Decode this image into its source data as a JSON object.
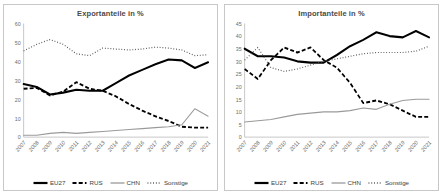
{
  "charts": [
    {
      "title": "Exportanteile in %",
      "ylim": [
        0,
        60
      ],
      "yticks": [
        0,
        10,
        20,
        30,
        40,
        50,
        60
      ]
    },
    {
      "title": "Importanteile in %",
      "ylim": [
        0,
        45
      ],
      "yticks": [
        0,
        5,
        10,
        15,
        20,
        25,
        30,
        35,
        40,
        45
      ]
    }
  ],
  "legend": [
    {
      "label": "EU27",
      "style": "solid-thick",
      "color": "#000000"
    },
    {
      "label": "RUS",
      "style": "dashed",
      "color": "#000000"
    },
    {
      "label": "CHN",
      "style": "solid-thin",
      "color": "#9a9a9a"
    },
    {
      "label": "Sonstige",
      "style": "dotted",
      "color": "#545454"
    }
  ],
  "chart_data": [
    {
      "type": "line",
      "title": "Exportanteile in %",
      "xlabel": "",
      "ylabel": "",
      "ylim": [
        0,
        60
      ],
      "yticks": [
        0,
        10,
        20,
        30,
        40,
        50,
        60
      ],
      "grid": false,
      "legend_position": "bottom",
      "x": [
        2007,
        2008,
        2009,
        2010,
        2011,
        2012,
        2013,
        2014,
        2015,
        2016,
        2017,
        2018,
        2019,
        2020,
        2021
      ],
      "series": [
        {
          "name": "EU27",
          "values": [
            28.0,
            26.5,
            22.5,
            23.5,
            25.0,
            24.5,
            24.5,
            28.5,
            32.5,
            35.5,
            38.5,
            41.0,
            40.5,
            36.5,
            39.5
          ]
        },
        {
          "name": "RUS",
          "values": [
            25.5,
            26.0,
            22.0,
            24.0,
            29.0,
            25.5,
            24.5,
            21.5,
            17.5,
            14.0,
            11.0,
            8.5,
            5.5,
            5.0,
            5.0
          ]
        },
        {
          "name": "CHN",
          "values": [
            1.0,
            1.0,
            2.0,
            2.5,
            2.0,
            2.5,
            3.0,
            3.5,
            4.0,
            4.5,
            5.0,
            5.5,
            6.5,
            15.0,
            11.0
          ]
        },
        {
          "name": "Sonstige",
          "values": [
            45.5,
            49.0,
            51.5,
            49.0,
            44.0,
            43.0,
            47.0,
            46.5,
            46.0,
            46.5,
            47.5,
            47.0,
            46.0,
            43.0,
            43.5
          ]
        }
      ]
    },
    {
      "type": "line",
      "title": "Importanteile in %",
      "xlabel": "",
      "ylabel": "",
      "ylim": [
        0,
        45
      ],
      "yticks": [
        0,
        5,
        10,
        15,
        20,
        25,
        30,
        35,
        40,
        45
      ],
      "grid": false,
      "legend_position": "bottom",
      "x": [
        2007,
        2008,
        2009,
        2010,
        2011,
        2012,
        2013,
        2014,
        2015,
        2016,
        2017,
        2018,
        2019,
        2020,
        2021
      ],
      "series": [
        {
          "name": "EU27",
          "values": [
            35.0,
            32.0,
            32.0,
            31.5,
            30.0,
            29.5,
            29.5,
            32.5,
            36.0,
            38.5,
            41.5,
            40.0,
            39.5,
            42.0,
            39.5
          ]
        },
        {
          "name": "RUS",
          "values": [
            27.0,
            23.0,
            30.5,
            35.5,
            33.5,
            35.5,
            30.5,
            27.5,
            21.5,
            13.5,
            14.5,
            13.0,
            10.5,
            8.0,
            8.0
          ]
        },
        {
          "name": "CHN",
          "values": [
            6.0,
            6.5,
            7.0,
            8.0,
            9.0,
            9.5,
            10.0,
            10.0,
            10.5,
            11.5,
            11.0,
            13.0,
            14.5,
            15.0,
            15.0
          ]
        },
        {
          "name": "Sonstige",
          "values": [
            30.5,
            35.5,
            27.5,
            26.0,
            27.0,
            28.5,
            30.0,
            31.0,
            32.0,
            33.0,
            33.5,
            33.5,
            33.5,
            34.0,
            36.0
          ]
        }
      ]
    }
  ]
}
